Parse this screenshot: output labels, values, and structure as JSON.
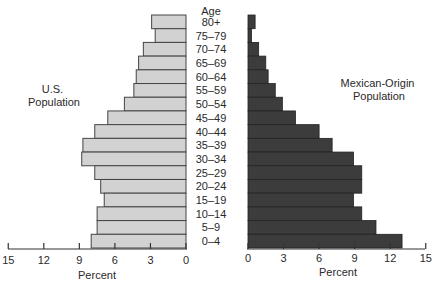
{
  "chart_data": {
    "type": "bar",
    "orientation": "horizontal-population-pyramid",
    "title": "",
    "category_header": "Age",
    "categories": [
      "80+",
      "75–79",
      "70–74",
      "65–69",
      "60–64",
      "55–59",
      "50–54",
      "45–49",
      "40–44",
      "35–39",
      "30–34",
      "25–29",
      "20–24",
      "15–19",
      "10–14",
      "5–9",
      "0–4"
    ],
    "series": [
      {
        "name": "U.S. Population",
        "label_lines": [
          "U.S.",
          "Population"
        ],
        "side": "left",
        "color": "#d2d2d2",
        "values": [
          2.9,
          2.6,
          3.6,
          4.0,
          4.2,
          4.4,
          5.2,
          6.6,
          7.7,
          8.7,
          8.8,
          7.7,
          7.2,
          6.9,
          7.5,
          7.5,
          8.0
        ]
      },
      {
        "name": "Mexican-Origin Population",
        "label_lines": [
          "Mexican-Origin",
          "Population"
        ],
        "side": "right",
        "color": "#3c3c3c",
        "values": [
          0.6,
          0.3,
          0.9,
          1.5,
          1.7,
          2.3,
          2.9,
          4.0,
          6.0,
          7.1,
          8.9,
          9.6,
          9.6,
          8.9,
          9.6,
          10.8,
          13.0
        ]
      }
    ],
    "xlabel_left": "Percent",
    "xlabel_right": "Percent",
    "ylabel": "Age",
    "xlim": [
      0,
      15
    ],
    "left_ticks": [
      "15",
      "12",
      "9",
      "6",
      "3",
      "0"
    ],
    "right_ticks": [
      "0",
      "3",
      "6",
      "9",
      "12",
      "15"
    ],
    "grid": false,
    "legend": "inline labels beside each half"
  }
}
